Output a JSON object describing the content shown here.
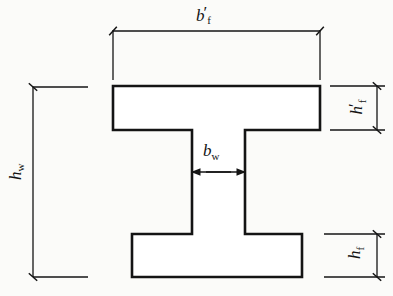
{
  "figure": {
    "kind": "engineering-cross-section-diagram",
    "background_color": "#fbfbf9",
    "line_color": "#141414"
  },
  "labels": {
    "top_flange_width": {
      "name": "b-prime-f",
      "variable": "b",
      "prime": "′",
      "subscript": "f",
      "meaning": "top flange width"
    },
    "top_flange_thickness": {
      "name": "h-prime-f",
      "variable": "h",
      "prime": "′",
      "subscript": "f",
      "meaning": "top flange thickness"
    },
    "web_height": {
      "name": "h-w",
      "variable": "h",
      "prime": "",
      "subscript": "w",
      "meaning": "web / overall height"
    },
    "web_thickness": {
      "name": "b-w",
      "variable": "b",
      "prime": "",
      "subscript": "w",
      "meaning": "web thickness"
    },
    "bottom_flange_thickness": {
      "name": "h-f",
      "variable": "h",
      "prime": "",
      "subscript": "f",
      "meaning": "bottom flange thickness"
    }
  },
  "geometry": {
    "top_flange": {
      "x1": 113,
      "x2": 320,
      "y1": 86,
      "y2": 130
    },
    "bottom_flange": {
      "x1": 132,
      "x2": 302,
      "y1": 234,
      "y2": 277
    },
    "web": {
      "x1": 192,
      "x2": 245,
      "y1": 130,
      "y2": 234
    },
    "dimension_lines": {
      "bf_top": {
        "y": 31,
        "x1": 113,
        "x2": 320
      },
      "hf_top": {
        "x": 377,
        "y1": 86,
        "y2": 130
      },
      "hw_left": {
        "x": 33,
        "y1": 87,
        "y2": 277
      },
      "bw_web": {
        "y": 172,
        "x1": 192,
        "x2": 245
      },
      "hf_bottom": {
        "x": 377,
        "y1": 234,
        "y2": 277
      }
    }
  }
}
